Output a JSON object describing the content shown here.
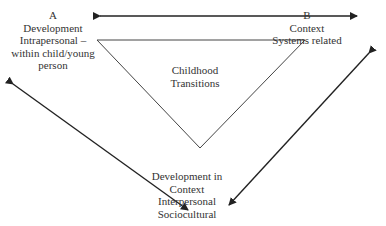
{
  "diagram": {
    "node_a": {
      "lines": [
        "A",
        "Development",
        "Intrapersonal –",
        "within child/young",
        "person"
      ]
    },
    "node_b": {
      "lines": [
        "B",
        "Context",
        "Systems related"
      ]
    },
    "center": {
      "lines": [
        "Childhood",
        "Transitions"
      ]
    },
    "node_bottom": {
      "lines": [
        "Development in",
        "Context",
        "Interpersonal",
        "Sociocultural"
      ]
    },
    "colors": {
      "line": "#333333",
      "text": "#333333",
      "background": "#ffffff"
    }
  }
}
